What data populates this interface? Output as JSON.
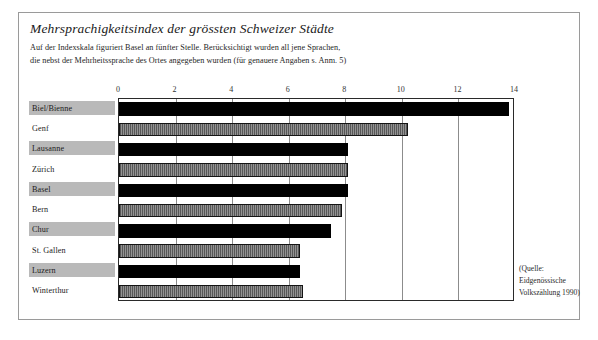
{
  "figure": {
    "title": "Mehrsprachigkeitsindex der grössten Schweizer Städte",
    "subtitle_line1": "Auf der Indexskala figuriert Basel an fünfter Stelle. Berücksichtigt wurden all jene Sprachen,",
    "subtitle_line2": "die nebst der Mehrheitssprache des Ortes angegeben wurden (für genauere Angaben s. Anm. 5)",
    "source_line1": "(Quelle:",
    "source_line2": "Eidgenössische",
    "source_line3": "Volkszählung 1990)"
  },
  "colors": {
    "bar_dark": "#000000",
    "bar_hatch": "#7d7d7d",
    "label_band": "#b9b9b9",
    "frame": "#9a9a9a",
    "axis": "#2a2a2a",
    "grid": "#8c8c8c"
  },
  "chart_data": {
    "type": "bar",
    "orientation": "horizontal",
    "title": "Mehrsprachigkeitsindex der grössten Schweizer Städte",
    "xlabel": "",
    "ylabel": "",
    "xlim": [
      0,
      14
    ],
    "ticks": [
      0,
      2,
      4,
      6,
      8,
      10,
      12,
      14
    ],
    "tick_labels": [
      "0",
      "2",
      "4",
      "6",
      "8",
      "10",
      "12",
      "14"
    ],
    "grid": true,
    "legend": "none",
    "categories": [
      "Biel/Bienne",
      "Genf",
      "Lausanne",
      "Zürich",
      "Basel",
      "Bern",
      "Chur",
      "St. Gallen",
      "Luzern",
      "Winterthur"
    ],
    "values": [
      13.8,
      10.2,
      8.1,
      8.1,
      8.1,
      7.9,
      7.5,
      6.4,
      6.4,
      6.5
    ],
    "bar_styles": [
      "dark",
      "hatch",
      "dark",
      "hatch",
      "dark",
      "hatch",
      "dark",
      "hatch",
      "dark",
      "hatch"
    ],
    "label_banded": [
      true,
      false,
      true,
      false,
      true,
      false,
      true,
      false,
      true,
      false
    ]
  }
}
